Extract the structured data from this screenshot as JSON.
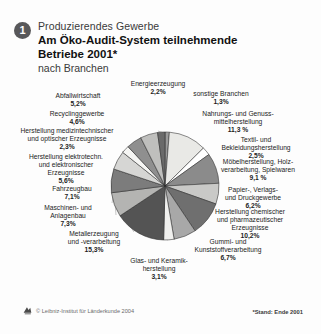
{
  "header": {
    "badge": "1",
    "kicker": "Produzierendes Gewerbe",
    "title": "Am Öko-Audit-System teilnehmende\nBetriebe 2001*",
    "subtitle": "nach Branchen"
  },
  "footer": {
    "credit": "© Leibniz-Institut für Länderkunde 2004",
    "credit_icon": "ifl-logo-icon",
    "note": "*Stand: Ende 2001"
  },
  "colors": {
    "background": "#fdfdfd",
    "badge": "#58585a",
    "leader_line": "#8d8d8d",
    "outline": "#2b2b2b"
  },
  "chart_data": {
    "type": "pie",
    "title": "Am Öko-Audit-System teilnehmende Betriebe 2001",
    "subtitle": "nach Branchen",
    "unit": "%",
    "start_angle_deg": -90,
    "direction": "clockwise",
    "center": [
      165,
      186
    ],
    "radius": 54,
    "legend": "labels-outside-with-leader-lines",
    "grid": false,
    "categories": [
      "sonstige Branchen",
      "Nahrungs- und Genuss-mittelherstellung",
      "Textil- und Bekleidungsherstellung",
      "Möbelherstellung, Holz-verarbeitung, Spielwaren",
      "Papier-, Verlags- und Druckgewerbe",
      "Herstellung chemischer und pharmazeutischer Erzeugnisse",
      "Gummi- und Kunststoffverarbeitung",
      "Glas- und Keramik-herstellung",
      "Metallerzeugung und -verarbeitung",
      "Maschinen- und Anlagenbau",
      "Fahrzeugbau",
      "Herstellung elektrotechn. und elektronischer Erzeugnisse",
      "Herstellung medizintechnischer und optischer Erzeugnisse",
      "Recyclinggewerbe",
      "Abfallwirtschaft",
      "Energieerzeugung"
    ],
    "values": [
      1.3,
      11.3,
      2.5,
      9.1,
      6.2,
      10.2,
      6.7,
      3.1,
      15.3,
      7.3,
      7.1,
      5.6,
      2.3,
      4.6,
      5.2,
      2.2
    ],
    "value_labels": [
      "1,3%",
      "11,3 %",
      "2,5%",
      "9,1 %",
      "6,2%",
      "10,2%",
      "6,7%",
      "3,1%",
      "15,3%",
      "7,3%",
      "7,1%",
      "5,6%",
      "2,3%",
      "4,6%",
      "5,2%",
      "2,2%"
    ],
    "slice_colors": [
      "#9b9b9b",
      "#e9e9e6",
      "#ffffff",
      "#8b8b8b",
      "#c9c9c7",
      "#6f6f6f",
      "#a8a8a8",
      "#f0f0ee",
      "#545454",
      "#b4b4b2",
      "#7c7c7c",
      "#d6d6d4",
      "#f5f5f3",
      "#8f8f8f",
      "#bfbfbd",
      "#6a6a6a"
    ]
  },
  "labels": [
    {
      "name": "label-energieerzeugung",
      "text": "Energieerzeugung",
      "pct": "2,2%"
    },
    {
      "name": "label-sonstige-branchen",
      "text": "sonstige Branchen",
      "pct": "1,3%"
    },
    {
      "name": "label-nahrungs",
      "text": "Nahrungs- und Genuss-\nmittelherstellung",
      "pct": "11,3 %"
    },
    {
      "name": "label-textil",
      "text": "Textil- und\nBekleidungsherstellung",
      "pct": "2,5%"
    },
    {
      "name": "label-moebel",
      "text": "Möbelherstellung, Holz-\nverarbeitung, Spielwaren",
      "pct": "9,1 %"
    },
    {
      "name": "label-papier",
      "text": "Papier-, Verlags-\nund Druckgewerbe",
      "pct": "6,2%"
    },
    {
      "name": "label-chemie",
      "text": "Herstellung chemischer\nund pharmazeutischer\nErzeugnisse",
      "pct": "10,2%"
    },
    {
      "name": "label-gummi",
      "text": "Gummi- und\nKunststoffverarbeitung",
      "pct": "6,7%"
    },
    {
      "name": "label-glas",
      "text": "Glas- und Keramik-\nherstellung",
      "pct": "3,1%"
    },
    {
      "name": "label-metall",
      "text": "Metallerzeugung\nund -verarbeitung",
      "pct": "15,3%"
    },
    {
      "name": "label-maschinen",
      "text": "Maschinen- und\nAnlagenbau",
      "pct": "7,3%"
    },
    {
      "name": "label-fahrzeugbau",
      "text": "Fahrzeugbau",
      "pct": "7,1%"
    },
    {
      "name": "label-elektro",
      "text": "Herstellung elektrotechn.\nund elektronischer\nErzeugnisse",
      "pct": "5,6%"
    },
    {
      "name": "label-medizintechnik",
      "text": "Herstellung medizintechnischer\nund optischer Erzeugnisse",
      "pct": "2,3%"
    },
    {
      "name": "label-recycling",
      "text": "Recyclinggewerbe",
      "pct": "4,6%"
    },
    {
      "name": "label-abfall",
      "text": "Abfallwirtschaft",
      "pct": "5,2%"
    }
  ]
}
